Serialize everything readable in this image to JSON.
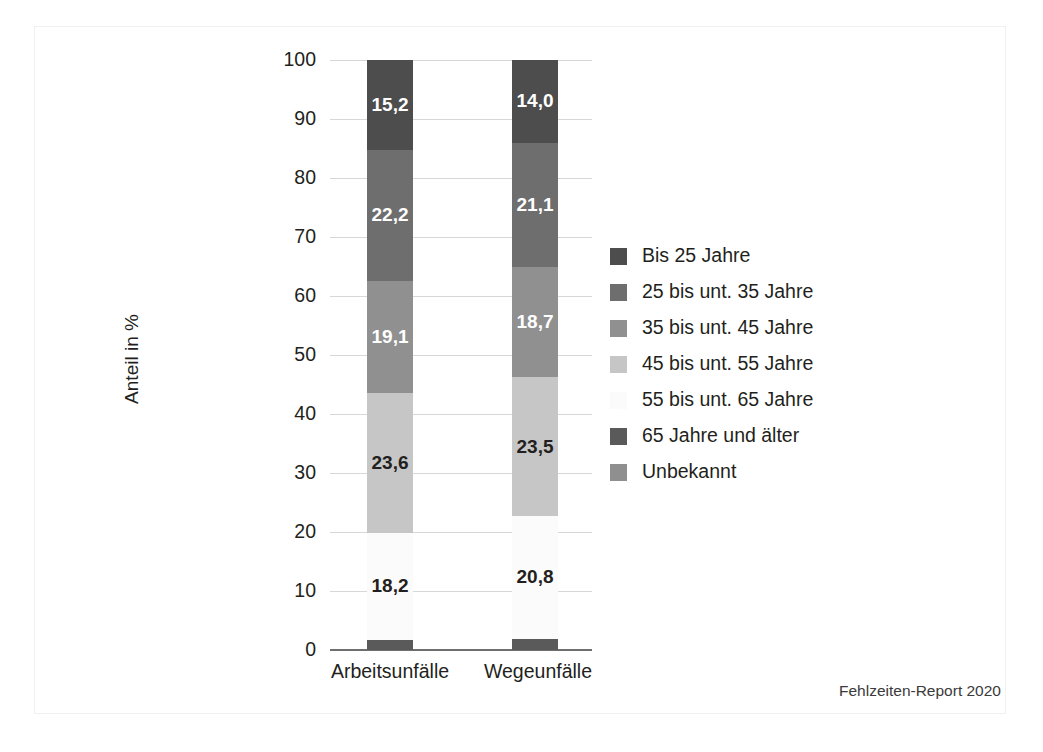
{
  "chart_data": {
    "type": "bar",
    "subtype": "stacked-100-percent",
    "title": "",
    "xlabel": "",
    "ylabel": "Anteil in %",
    "ylim": [
      0,
      100
    ],
    "yticks": [
      0,
      10,
      20,
      30,
      40,
      50,
      60,
      70,
      80,
      90,
      100
    ],
    "ytick_labels": [
      "0",
      "10",
      "20",
      "30",
      "40",
      "50",
      "60",
      "70",
      "80",
      "90",
      "100"
    ],
    "grid": true,
    "legend_position": "right",
    "categories": [
      "Arbeitsunfälle",
      "Wegeunfälle"
    ],
    "series": [
      {
        "name": "Bis 25 Jahre",
        "color": "#4d4d4d",
        "values": [
          15.2,
          14.0
        ],
        "labels": [
          "15,2",
          "14,0"
        ],
        "label_color": "on-dark"
      },
      {
        "name": "25 bis unt. 35 Jahre",
        "color": "#6e6e6e",
        "values": [
          22.2,
          21.1
        ],
        "labels": [
          "22,2",
          "21,1"
        ],
        "label_color": "on-dark"
      },
      {
        "name": "35 bis unt. 45 Jahre",
        "color": "#909090",
        "values": [
          19.1,
          18.7
        ],
        "labels": [
          "19,1",
          "18,7"
        ],
        "label_color": "on-dark"
      },
      {
        "name": "45 bis unt. 55 Jahre",
        "color": "#c6c6c6",
        "values": [
          23.6,
          23.5
        ],
        "labels": [
          "23,6",
          "23,5"
        ],
        "label_color": "on-light"
      },
      {
        "name": "55 bis unt. 65 Jahre",
        "color": "#fbfbfb",
        "values": [
          18.2,
          20.8
        ],
        "labels": [
          "18,2",
          "20,8"
        ],
        "label_color": "on-light"
      },
      {
        "name": "65 Jahre und älter",
        "color": "#5a5a5a",
        "values": [
          1.7,
          1.9
        ],
        "labels": [
          "",
          ""
        ],
        "label_color": "on-dark"
      },
      {
        "name": "Unbekannt",
        "color": "#8f8f8f",
        "values": [
          0.0,
          0.0
        ],
        "labels": [
          "",
          ""
        ],
        "label_color": "on-dark"
      }
    ]
  },
  "legend": {
    "items": [
      {
        "label": "Bis 25 Jahre",
        "color": "#4d4d4d"
      },
      {
        "label": "25 bis unt. 35 Jahre",
        "color": "#6e6e6e"
      },
      {
        "label": "35 bis unt. 45 Jahre",
        "color": "#909090"
      },
      {
        "label": "45 bis unt. 55 Jahre",
        "color": "#c6c6c6"
      },
      {
        "label": "55 bis unt. 65 Jahre",
        "color": "#fbfbfb"
      },
      {
        "label": "65 Jahre und älter",
        "color": "#5a5a5a"
      },
      {
        "label": "Unbekannt",
        "color": "#8f8f8f"
      }
    ]
  },
  "footer": {
    "source": "Fehlzeiten-Report 2020"
  },
  "colors": {
    "gridline": "#d7d7d7",
    "axis": "#6f6f6f",
    "text": "#231f20",
    "background": "#ffffff"
  }
}
